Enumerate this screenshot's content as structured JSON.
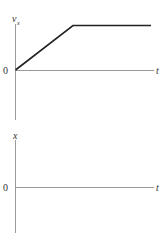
{
  "top_graph": {
    "y_label": "v",
    "y_label_sub": "x",
    "x_label": "t",
    "origin_label": "0",
    "curve_description": "linear increase from origin then constant",
    "colors": {
      "axis": "#9a9a9a",
      "curve": "#222222",
      "text": "#333333"
    }
  },
  "bottom_graph": {
    "y_label": "x",
    "x_label": "t",
    "origin_label": "0",
    "colors": {
      "axis": "#9a9a9a",
      "text": "#333333"
    }
  }
}
